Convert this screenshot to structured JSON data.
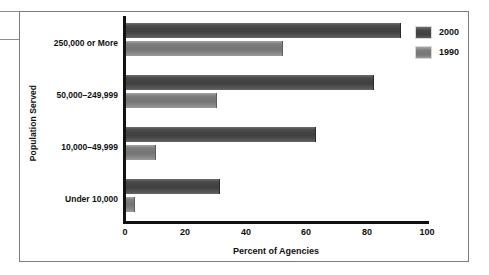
{
  "figure": {
    "frame_border_color": "#7b7b7b",
    "background_color": "#ffffff"
  },
  "legend": {
    "position": "top-right",
    "entries": [
      {
        "label": "2000",
        "swatch": "dark-gray-swatch",
        "color": "#434343"
      },
      {
        "label": "1990",
        "swatch": "medium-gray-swatch",
        "color": "#7d7d7d"
      }
    ]
  },
  "axes": {
    "y_title": "Population Served",
    "x_title": "Percent of Agencies",
    "x_ticks": [
      "0",
      "20",
      "40",
      "60",
      "80",
      "100"
    ]
  },
  "categories": [
    {
      "label": "250,000 or More"
    },
    {
      "label": "50,000–249,999"
    },
    {
      "label": "10,000–49,999"
    },
    {
      "label": "Under 10,000"
    }
  ],
  "chart_data": {
    "type": "bar",
    "orientation": "horizontal",
    "title": "",
    "subtitle": "",
    "xlabel": "Percent of Agencies",
    "ylabel": "Population Served",
    "xlim": [
      0,
      100
    ],
    "xticks": [
      0,
      20,
      40,
      60,
      80,
      100
    ],
    "grid": false,
    "legend_position": "top-right",
    "categories": [
      "250,000 or More",
      "50,000–249,999",
      "10,000–49,999",
      "Under 10,000"
    ],
    "series": [
      {
        "name": "2000",
        "color": "#434343",
        "values": [
          91,
          82,
          63,
          31
        ]
      },
      {
        "name": "1990",
        "color": "#7d7d7d",
        "values": [
          52,
          30,
          10,
          3
        ]
      }
    ]
  }
}
